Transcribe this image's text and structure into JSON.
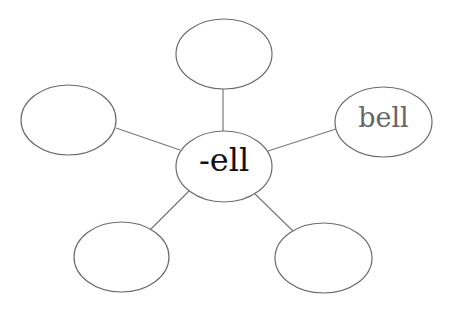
{
  "diagram": {
    "type": "word-family web",
    "center": {
      "label": "-ell"
    },
    "spokes": [
      {
        "position": "top",
        "label": ""
      },
      {
        "position": "left",
        "label": ""
      },
      {
        "position": "right",
        "label": "bell"
      },
      {
        "position": "bottom-left",
        "label": ""
      },
      {
        "position": "bottom-right",
        "label": ""
      }
    ],
    "colors": {
      "stroke": "#6b6b6b",
      "center_text": "#111111",
      "spoke_text": "#666666"
    }
  }
}
